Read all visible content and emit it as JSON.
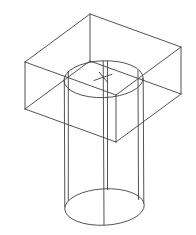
{
  "drawing": {
    "description": "Isometric CAD wireframe drawing of a rectangular block with a cylinder passing vertically through it; circular hole edge with center mark on the top face and full cylinder base ellipse below",
    "canvas": {
      "width": 196,
      "height": 235
    },
    "background_color": "#ffffff",
    "stroke_color": "#3f3f3f",
    "stroke_width": 0.9,
    "box": {
      "top_face_corners": {
        "back": {
          "x": 90,
          "y": 14
        },
        "left": {
          "x": 25,
          "y": 62
        },
        "front": {
          "x": 116,
          "y": 95
        },
        "right": {
          "x": 181,
          "y": 47
        }
      },
      "height_px": 47,
      "edges": [
        {
          "x1": 90,
          "y1": 14,
          "x2": 25,
          "y2": 62
        },
        {
          "x1": 25,
          "y1": 62,
          "x2": 116,
          "y2": 95
        },
        {
          "x1": 116,
          "y1": 95,
          "x2": 181,
          "y2": 47
        },
        {
          "x1": 181,
          "y1": 47,
          "x2": 90,
          "y2": 14
        },
        {
          "x1": 90,
          "y1": 14,
          "x2": 90,
          "y2": 61
        },
        {
          "x1": 25,
          "y1": 62,
          "x2": 25,
          "y2": 109
        },
        {
          "x1": 116,
          "y1": 95,
          "x2": 116,
          "y2": 142
        },
        {
          "x1": 181,
          "y1": 47,
          "x2": 181,
          "y2": 94
        },
        {
          "x1": 90,
          "y1": 61,
          "x2": 25,
          "y2": 109
        },
        {
          "x1": 25,
          "y1": 109,
          "x2": 116,
          "y2": 142
        },
        {
          "x1": 116,
          "y1": 142,
          "x2": 181,
          "y2": 94
        },
        {
          "x1": 181,
          "y1": 94,
          "x2": 90,
          "y2": 61
        }
      ]
    },
    "cylinder": {
      "top_ellipse": {
        "cx": 103.5,
        "cy": 79.2,
        "rx": 39.6,
        "ry": 18.4,
        "rotate": -2
      },
      "base_ellipse": {
        "cx": 104.5,
        "cy": 207.0,
        "rx": 39.8,
        "ry": 18.2,
        "rotate": -3
      },
      "vertical_lines": [
        {
          "x1": 64.3,
          "y1": 80.0,
          "x2": 64.8,
          "y2": 206.9
        },
        {
          "x1": 68.3,
          "y1": 71.3,
          "x2": 68.3,
          "y2": 200.5
        },
        {
          "x1": 103.2,
          "y1": 61.2,
          "x2": 104.0,
          "y2": 224.9
        },
        {
          "x1": 107.5,
          "y1": 61.5,
          "x2": 107.5,
          "y2": 189.6
        },
        {
          "x1": 138.0,
          "y1": 70.7,
          "x2": 138.5,
          "y2": 199.5
        },
        {
          "x1": 143.2,
          "y1": 78.1,
          "x2": 143.8,
          "y2": 202.9
        }
      ]
    },
    "center_mark": {
      "center": {
        "x": 103.3,
        "y": 77.5
      },
      "strokes": [
        {
          "x1": 94.0,
          "y1": 80.5,
          "x2": 112.0,
          "y2": 74.2
        },
        {
          "x1": 99.3,
          "y1": 72.3,
          "x2": 107.5,
          "y2": 82.3
        }
      ]
    }
  }
}
